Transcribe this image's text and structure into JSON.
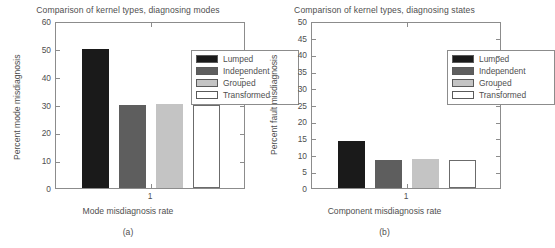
{
  "figure": {
    "panels": [
      {
        "id": "a",
        "subcaption": "(a)",
        "title": "Comparison of kernel types, diagnosing modes",
        "ylabel": "Percent mode misdiagnosis",
        "xlabel": "Mode misdiagnosis rate",
        "xtick_label": "1"
      },
      {
        "id": "b",
        "subcaption": "(b)",
        "title": "Comparison of kernel types, diagnosing states",
        "ylabel": "Percent fault misdiagnosis",
        "xlabel": "Component misdiagnosis rate",
        "xtick_label": "1"
      }
    ],
    "legend": {
      "items": [
        {
          "label": "Lumped",
          "color": "#1a1a1a"
        },
        {
          "label": "Independent",
          "color": "#5e5e5e"
        },
        {
          "label": "Grouped",
          "color": "#c4c4c4"
        },
        {
          "label": "Transformed",
          "color": "#ffffff"
        }
      ]
    }
  },
  "chart_data": [
    {
      "type": "bar",
      "panel": "a",
      "title": "Comparison of kernel types, diagnosing modes",
      "xlabel": "Mode misdiagnosis rate",
      "ylabel": "Percent mode misdiagnosis",
      "categories": [
        "Lumped",
        "Independent",
        "Grouped",
        "Transformed"
      ],
      "values": [
        50,
        29.8,
        30.1,
        29.7
      ],
      "ylim": [
        0,
        60
      ],
      "yticks": [
        0,
        10,
        20,
        30,
        40,
        50,
        60
      ],
      "xticks": [
        1
      ],
      "xtick_labels": [
        "1"
      ],
      "grid": false,
      "legend_position": "upper right",
      "colors": [
        "#1a1a1a",
        "#5e5e5e",
        "#c4c4c4",
        "#ffffff"
      ]
    },
    {
      "type": "bar",
      "panel": "b",
      "title": "Comparison of kernel types, diagnosing states",
      "xlabel": "Component misdiagnosis rate",
      "ylabel": "Percent fault misdiagnosis",
      "categories": [
        "Lumped",
        "Independent",
        "Grouped",
        "Transformed"
      ],
      "values": [
        14.0,
        8.3,
        8.6,
        8.3
      ],
      "ylim": [
        0,
        50
      ],
      "yticks": [
        0,
        5,
        10,
        15,
        20,
        25,
        30,
        35,
        40,
        45,
        50
      ],
      "xticks": [
        1
      ],
      "xtick_labels": [
        "1"
      ],
      "grid": false,
      "legend_position": "upper right",
      "colors": [
        "#1a1a1a",
        "#5e5e5e",
        "#c4c4c4",
        "#ffffff"
      ]
    }
  ]
}
